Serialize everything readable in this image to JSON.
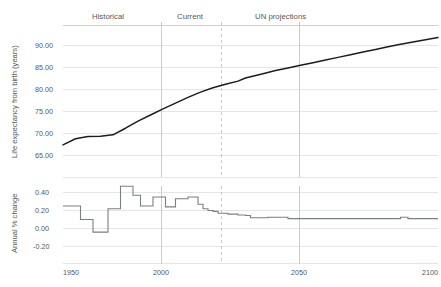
{
  "chart_data": {
    "type": "line",
    "title": "",
    "xlabel": "",
    "panels": [
      {
        "id": "life-expectancy",
        "ylabel": "Life expectancy from birth (years)",
        "yticks": [
          "90.00",
          "85.00",
          "80.00",
          "75.00",
          "70.00",
          "65.00"
        ],
        "ytick_values": [
          90,
          85,
          80,
          75,
          70,
          65
        ],
        "ylim": [
          62.5,
          93.5
        ],
        "grid": true,
        "series": [
          {
            "name": "Life expectancy at birth (years)",
            "color": "#1d1d1d",
            "x": [
              1950,
              1955,
              1960,
              1965,
              1970,
              1975,
              1980,
              1985,
              1990,
              1995,
              2000,
              2005,
              2010,
              2015,
              2020,
              2023,
              2025,
              2030,
              2035,
              2040,
              2045,
              2050,
              2055,
              2060,
              2065,
              2070,
              2075,
              2080,
              2085,
              2090,
              2095,
              2100
            ],
            "values": [
              67.4,
              68.8,
              69.3,
              69.4,
              69.7,
              71.2,
              72.8,
              74.2,
              75.6,
              76.9,
              78.2,
              79.4,
              80.4,
              81.2,
              81.9,
              82.6,
              82.9,
              83.6,
              84.3,
              84.9,
              85.5,
              86.1,
              86.7,
              87.3,
              87.9,
              88.5,
              89.1,
              89.7,
              90.3,
              90.8,
              91.3,
              91.8
            ]
          }
        ]
      },
      {
        "id": "annual-pct-change",
        "ylabel": "Annual % change",
        "yticks": [
          "0.40",
          "0.20",
          "0.00",
          "-0.20"
        ],
        "ytick_values": [
          0.4,
          0.2,
          0.0,
          -0.2
        ],
        "ylim": [
          -0.28,
          0.54
        ],
        "grid": true,
        "series": [
          {
            "name": "Annual % change in life expectancy",
            "color": "#7a7f85",
            "step": true,
            "x": [
              1950,
              1955,
              1957,
              1960,
              1962,
              1966,
              1968,
              1971,
              1973,
              1976,
              1978,
              1981,
              1983,
              1986,
              1988,
              1991,
              1993,
              1995,
              1997,
              2000,
              2002,
              2004,
              2006,
              2008,
              2010,
              2012,
              2014,
              2016,
              2018,
              2020,
              2022,
              2023,
              2025,
              2028,
              2032,
              2036,
              2040,
              2050,
              2060,
              2070,
              2082,
              2085,
              2088,
              2095,
              2100
            ],
            "values": [
              0.25,
              0.25,
              0.1,
              0.1,
              -0.04,
              -0.04,
              0.22,
              0.22,
              0.47,
              0.47,
              0.37,
              0.25,
              0.25,
              0.35,
              0.35,
              0.24,
              0.24,
              0.33,
              0.33,
              0.35,
              0.35,
              0.27,
              0.22,
              0.2,
              0.19,
              0.17,
              0.17,
              0.16,
              0.16,
              0.15,
              0.15,
              0.145,
              0.12,
              0.12,
              0.125,
              0.125,
              0.11,
              0.11,
              0.11,
              0.11,
              0.11,
              0.125,
              0.11,
              0.11,
              0.11
            ]
          }
        ]
      }
    ],
    "xticks": [
      "1950",
      "2000",
      "2050",
      "2100"
    ],
    "xtick_values": [
      1950,
      2000,
      2050,
      2100
    ],
    "xlim": [
      1950,
      2100
    ],
    "regions": [
      {
        "label": "Historical",
        "start": 1950,
        "end": 2000,
        "divider": "none"
      },
      {
        "label": "Current",
        "start": 2000,
        "end": 2023,
        "divider": "solid"
      },
      {
        "label": "UN projections",
        "start": 2023,
        "end": 2100,
        "divider": "dashed"
      }
    ],
    "dividers": [
      {
        "year": 2000,
        "style": "solid"
      },
      {
        "year": 2023,
        "style": "dashed"
      },
      {
        "year": 2050,
        "style": "solid"
      }
    ],
    "legend": "none",
    "colors": {
      "life_expectancy_line": "#1d1d1d",
      "pct_change_line": "#7a7f85",
      "gridline": "#dcdfe2",
      "text": "#54585c"
    }
  }
}
